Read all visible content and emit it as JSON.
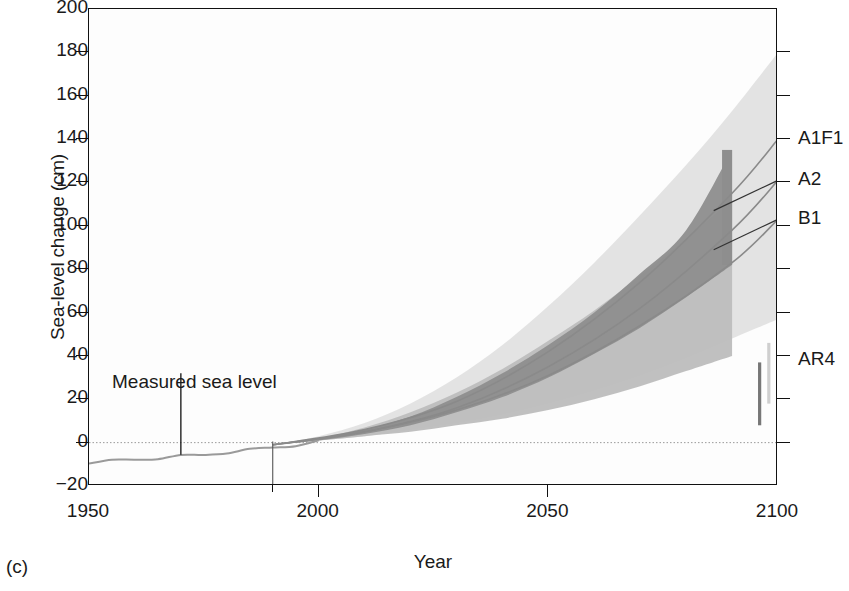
{
  "figure": {
    "panel_label": "(c)",
    "xlabel": "Year",
    "ylabel": "Sea-level change (cm)"
  },
  "annotations": {
    "measured": "Measured sea level"
  },
  "scenario_labels": [
    {
      "name": "A1F1",
      "value_cm": 140
    },
    {
      "name": "A2",
      "value_cm": 121
    },
    {
      "name": "B1",
      "value_cm": 103
    },
    {
      "name": "AR4",
      "value_cm": 38
    }
  ],
  "colors": {
    "axis": "#111111",
    "outer_envelope": "#e2e2e2",
    "mid_band": "#bdbdbd",
    "dark_band": "#8e8e8e",
    "measured_line": "#9a9a9a",
    "projection_line": "#8a8a8a",
    "ar4_light": "#cfcfcf",
    "ar4_dark": "#777777"
  },
  "chart_data": {
    "type": "area",
    "title": "",
    "xlabel": "Year",
    "ylabel": "Sea-level change (cm)",
    "xlim": [
      1950,
      2100
    ],
    "ylim": [
      -20,
      200
    ],
    "grid": false,
    "legend_position": "right-axis-labels",
    "yticks": [
      -20,
      0,
      20,
      40,
      60,
      80,
      100,
      120,
      140,
      160,
      180,
      200
    ],
    "xticks": [
      1950,
      2000,
      2050,
      2100
    ],
    "xticks_minor": [
      1990
    ],
    "zero_reference_line": 0,
    "series": [
      {
        "name": "Measured sea level",
        "type": "line",
        "x": [
          1950,
          1955,
          1960,
          1965,
          1970,
          1975,
          1980,
          1985,
          1990,
          1995,
          2000
        ],
        "values": [
          -9,
          -8.4,
          -7.6,
          -7.0,
          -6.2,
          -5.4,
          -4.4,
          -3.4,
          -2.0,
          -1.0,
          0.5
        ]
      },
      {
        "name": "Outer envelope (full range of projections)",
        "type": "band",
        "x": [
          1990,
          2000,
          2010,
          2020,
          2030,
          2040,
          2050,
          2060,
          2070,
          2080,
          2090,
          2100
        ],
        "lower": [
          -1,
          1,
          3,
          6,
          9,
          13,
          18,
          24,
          31,
          39,
          48,
          57
        ],
        "upper": [
          -1,
          3,
          9,
          18,
          30,
          45,
          63,
          83,
          105,
          128,
          153,
          180
        ]
      },
      {
        "name": "Mid band (ice-sheet scaled range)",
        "type": "band",
        "x": [
          1990,
          2000,
          2010,
          2020,
          2030,
          2040,
          2050,
          2060,
          2070,
          2080,
          2090
        ],
        "lower": [
          -1,
          1,
          3,
          5,
          8,
          11,
          15,
          20,
          26,
          33,
          40
        ],
        "upper": [
          -1,
          2,
          7,
          14,
          23,
          34,
          47,
          61,
          77,
          94,
          112
        ]
      },
      {
        "name": "Dark band (A1F1 upper range)",
        "type": "band",
        "x": [
          1990,
          2000,
          2010,
          2020,
          2030,
          2040,
          2050,
          2060,
          2070,
          2080,
          2090
        ],
        "lower": [
          -1,
          1,
          4,
          8,
          14,
          21,
          30,
          41,
          53,
          67,
          82
        ],
        "upper": [
          -1,
          2,
          6,
          12,
          21,
          32,
          45,
          60,
          78,
          98,
          135
        ]
      },
      {
        "name": "A1F1",
        "type": "line",
        "x": [
          1990,
          2010,
          2030,
          2050,
          2070,
          2090,
          2100
        ],
        "values": [
          -1,
          6,
          19,
          42,
          74,
          115,
          140
        ]
      },
      {
        "name": "A2",
        "type": "line",
        "x": [
          1990,
          2010,
          2030,
          2050,
          2070,
          2090,
          2100
        ],
        "values": [
          -1,
          5,
          16,
          35,
          62,
          98,
          121
        ]
      },
      {
        "name": "B1",
        "type": "line",
        "x": [
          1990,
          2010,
          2030,
          2050,
          2070,
          2090,
          2100
        ],
        "values": [
          -1,
          5,
          15,
          31,
          54,
          83,
          103
        ]
      },
      {
        "name": "AR4 range (light)",
        "type": "errorbar",
        "x": 2098,
        "low": 18,
        "high": 46
      },
      {
        "name": "AR4 range (dark)",
        "type": "errorbar",
        "x": 2096,
        "low": 8,
        "high": 37
      }
    ],
    "annotations": [
      {
        "text": "Measured sea level",
        "x": 1970,
        "y": 33
      }
    ]
  }
}
